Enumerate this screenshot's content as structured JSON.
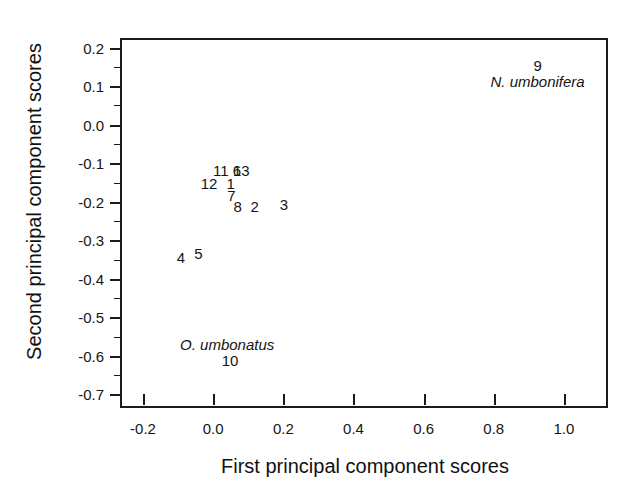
{
  "chart_data": {
    "type": "scatter",
    "title": "",
    "xlabel": "First principal component scores",
    "ylabel": "Second principal component scores",
    "xlim": [
      -0.26,
      1.12
    ],
    "ylim": [
      -0.73,
      0.22
    ],
    "grid": false,
    "legend": null,
    "xticks": [
      -0.2,
      0.0,
      0.2,
      0.4,
      0.6,
      0.8,
      1.0
    ],
    "xticklabels": [
      "-0.2",
      "0.0",
      "0.2",
      "0.4",
      "0.6",
      "0.8",
      "1.0"
    ],
    "yticks": [
      0.2,
      0.1,
      0.0,
      -0.1,
      -0.2,
      -0.3,
      -0.4,
      -0.5,
      -0.6,
      -0.7
    ],
    "yticklabels": [
      "0.2",
      "0.1",
      "0.0",
      "-0.1",
      "-0.2",
      "-0.3",
      "-0.4",
      "-0.5",
      "-0.6",
      "-0.7"
    ],
    "yminorticks": [
      0.15,
      0.05,
      -0.05,
      -0.15,
      -0.25,
      -0.35,
      -0.45,
      -0.55,
      -0.65
    ],
    "marker_style": "numeric-text-label",
    "points": [
      {
        "label": "9",
        "x": 0.925,
        "y": 0.155
      },
      {
        "label": "11",
        "x": 0.022,
        "y": -0.117
      },
      {
        "label": "6",
        "x": 0.068,
        "y": -0.117
      },
      {
        "label": "13",
        "x": 0.08,
        "y": -0.117
      },
      {
        "label": "12",
        "x": -0.012,
        "y": -0.152
      },
      {
        "label": "1",
        "x": 0.05,
        "y": -0.15
      },
      {
        "label": "7",
        "x": 0.052,
        "y": -0.182
      },
      {
        "label": "8",
        "x": 0.07,
        "y": -0.212
      },
      {
        "label": "2",
        "x": 0.118,
        "y": -0.21
      },
      {
        "label": "3",
        "x": 0.202,
        "y": -0.205
      },
      {
        "label": "4",
        "x": -0.092,
        "y": -0.343
      },
      {
        "label": "5",
        "x": -0.042,
        "y": -0.332
      },
      {
        "label": "10",
        "x": 0.048,
        "y": -0.61
      }
    ],
    "annotations": [
      {
        "text": "N. umbonifera",
        "x": 0.925,
        "y": 0.113,
        "style": "italic"
      },
      {
        "text": "O. umbonatus",
        "x": 0.04,
        "y": -0.568,
        "style": "italic"
      }
    ],
    "colors": {
      "axis": "#1b1b1b",
      "text": "#141414",
      "background": "#ffffff"
    }
  }
}
